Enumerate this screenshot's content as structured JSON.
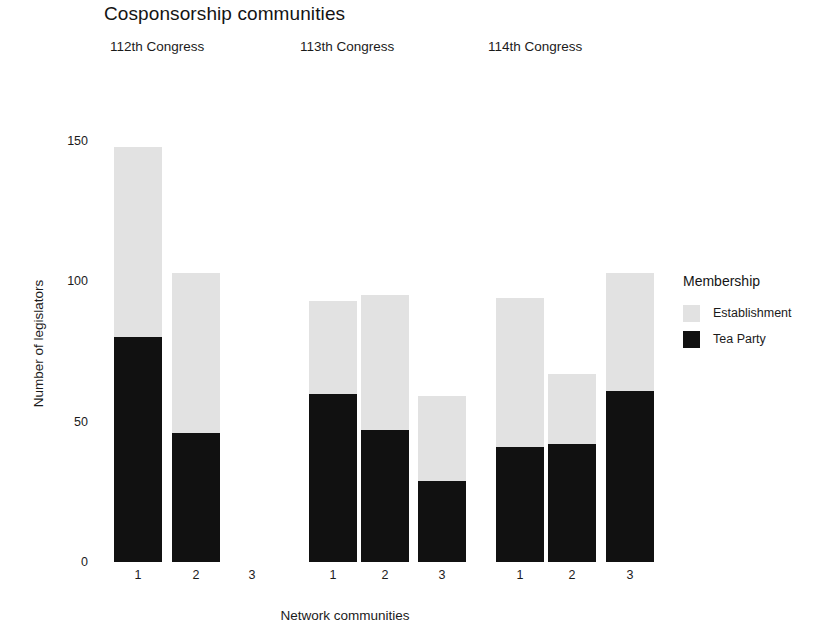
{
  "chart_data": {
    "type": "bar",
    "title": "Cosponsorship communities",
    "subtitle": "",
    "xlabel": "Network communities",
    "ylabel": "Number of legislators",
    "stacked": true,
    "grid": false,
    "legend_position": "right",
    "legend_title": "Membership",
    "ylim": [
      0,
      150
    ],
    "yticks": [
      0,
      50,
      100,
      150
    ],
    "ytick_labels": [
      "0",
      "50",
      "100",
      "150"
    ],
    "categories": [
      "1",
      "2",
      "3"
    ],
    "panels": [
      {
        "label": "112th Congress",
        "categories": [
          "1",
          "2",
          "3"
        ],
        "series": [
          {
            "name": "Tea Party",
            "color": "#111111",
            "values": [
              80,
              46,
              0
            ]
          },
          {
            "name": "Establishment",
            "color": "#e2e2e2",
            "values": [
              68,
              57,
              0
            ]
          }
        ],
        "totals": [
          148,
          103,
          0
        ]
      },
      {
        "label": "113th Congress",
        "categories": [
          "1",
          "2",
          "3"
        ],
        "series": [
          {
            "name": "Tea Party",
            "color": "#111111",
            "values": [
              60,
              47,
              29
            ]
          },
          {
            "name": "Establishment",
            "color": "#e2e2e2",
            "values": [
              33,
              48,
              30
            ]
          }
        ],
        "totals": [
          93,
          95,
          59
        ]
      },
      {
        "label": "114th Congress",
        "categories": [
          "1",
          "2",
          "3"
        ],
        "series": [
          {
            "name": "Tea Party",
            "color": "#111111",
            "values": [
              41,
              42,
              61
            ]
          },
          {
            "name": "Establishment",
            "color": "#e2e2e2",
            "values": [
              53,
              25,
              42
            ]
          }
        ],
        "totals": [
          94,
          67,
          103
        ]
      }
    ],
    "legend_entries": [
      {
        "label": "Establishment",
        "color": "#e2e2e2"
      },
      {
        "label": "Tea Party",
        "color": "#111111"
      }
    ]
  },
  "colors": {
    "establishment": "#e2e2e2",
    "tea_party": "#111111",
    "background": "#ffffff",
    "text": "#1b1b1b"
  },
  "layout": {
    "baseline_y": 562,
    "top_y": 141,
    "bar_width": 48,
    "panel_tick_x": [
      [
        138,
        196,
        252
      ],
      [
        333,
        385,
        442
      ],
      [
        520,
        572,
        630
      ]
    ],
    "panel_label_x": [
      110,
      300,
      488
    ]
  }
}
